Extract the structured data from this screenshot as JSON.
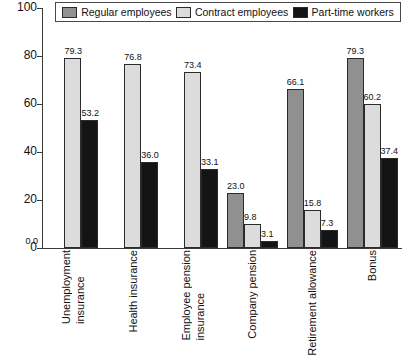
{
  "chart_data": {
    "type": "bar",
    "title": "",
    "subtitle": "",
    "xlabel": "",
    "ylabel": "",
    "ylim": [
      0,
      100
    ],
    "yticks": [
      0,
      20,
      40,
      60,
      80,
      100
    ],
    "grid": false,
    "legend_position": "top",
    "categories": [
      "Unemployment insurance",
      "Health insurance",
      "Employee pension insurance",
      "Company pension",
      "Retirement allowance",
      "Bonus"
    ],
    "category_lines": [
      [
        "Unemployment",
        "insurance"
      ],
      [
        "Health insurance"
      ],
      [
        "Employee pension",
        "insurance"
      ],
      [
        "Company pension"
      ],
      [
        "Retirement allowance"
      ],
      [
        "Bonus"
      ]
    ],
    "series": [
      {
        "name": "Regular employees",
        "color": "#909090",
        "values": [
          0.0,
          0.0,
          0.0,
          23.0,
          66.1,
          79.3
        ],
        "labels": [
          "0.0",
          "0.0",
          "0.0",
          "23.0",
          "66.1",
          "79.3"
        ]
      },
      {
        "name": "Contract employees",
        "color": "#dcdcdc",
        "values": [
          79.3,
          76.8,
          73.4,
          9.8,
          15.8,
          60.2
        ],
        "labels": [
          "79.3",
          "76.8",
          "73.4",
          "9.8",
          "15.8",
          "60.2"
        ]
      },
      {
        "name": "Part-time workers",
        "color": "#141414",
        "values": [
          53.2,
          36.0,
          33.1,
          3.1,
          7.3,
          37.4
        ],
        "labels": [
          "53.2",
          "36.0",
          "33.1",
          "3.1",
          "7.3",
          "37.4"
        ]
      }
    ]
  },
  "legend": {
    "entries": [
      {
        "label": "Regular employees",
        "color": "#909090"
      },
      {
        "label": "Contract employees",
        "color": "#dcdcdc"
      },
      {
        "label": "Part-time workers",
        "color": "#141414"
      }
    ]
  },
  "yaxis": {
    "ticks": [
      "0",
      "20",
      "40",
      "60",
      "80",
      "100"
    ]
  }
}
